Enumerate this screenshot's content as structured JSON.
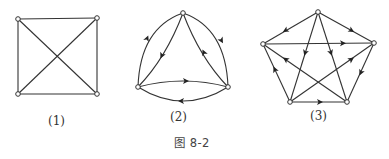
{
  "figure": {
    "caption": "图 8-2",
    "stroke_color": "#333333",
    "background": "#ffffff"
  },
  "graphs": [
    {
      "label": "(1)",
      "type": "undirected",
      "nodes": [
        {
          "id": "a",
          "x": 18,
          "y": 19
        },
        {
          "id": "b",
          "x": 97,
          "y": 18
        },
        {
          "id": "c",
          "x": 97,
          "y": 94
        },
        {
          "id": "d",
          "x": 18,
          "y": 94
        }
      ],
      "edges": [
        {
          "from": "a",
          "to": "b"
        },
        {
          "from": "b",
          "to": "c"
        },
        {
          "from": "c",
          "to": "d"
        },
        {
          "from": "d",
          "to": "a"
        },
        {
          "from": "a",
          "to": "c"
        },
        {
          "from": "b",
          "to": "d"
        }
      ]
    },
    {
      "label": "(2)",
      "type": "directed",
      "nodes": [
        {
          "id": "top",
          "x": 183,
          "y": 13
        },
        {
          "id": "left",
          "x": 138,
          "y": 87
        },
        {
          "id": "right",
          "x": 228,
          "y": 87
        }
      ],
      "edges": [
        {
          "from": "left",
          "to": "top",
          "shape": "outer-arc"
        },
        {
          "from": "top",
          "to": "right",
          "shape": "outer-arc"
        },
        {
          "from": "top",
          "to": "left",
          "shape": "inner"
        },
        {
          "from": "right",
          "to": "top",
          "shape": "inner"
        },
        {
          "from": "left",
          "to": "right",
          "shape": "upper-arc"
        },
        {
          "from": "right",
          "to": "left",
          "shape": "lower-arc"
        }
      ]
    },
    {
      "label": "(3)",
      "type": "directed",
      "nodes": [
        {
          "id": "top",
          "x": 318,
          "y": 12
        },
        {
          "id": "left",
          "x": 263,
          "y": 44
        },
        {
          "id": "right",
          "x": 374,
          "y": 43
        },
        {
          "id": "bl",
          "x": 290,
          "y": 102
        },
        {
          "id": "br",
          "x": 347,
          "y": 102
        }
      ],
      "edges": [
        {
          "from": "top",
          "to": "left"
        },
        {
          "from": "top",
          "to": "right"
        },
        {
          "from": "left",
          "to": "right"
        },
        {
          "from": "top",
          "to": "bl"
        },
        {
          "from": "top",
          "to": "br"
        },
        {
          "from": "right",
          "to": "br"
        },
        {
          "from": "bl",
          "to": "br"
        },
        {
          "from": "bl",
          "to": "left"
        },
        {
          "from": "br",
          "to": "left"
        },
        {
          "from": "bl",
          "to": "right"
        }
      ]
    }
  ]
}
